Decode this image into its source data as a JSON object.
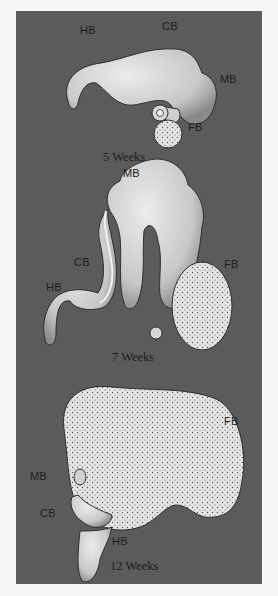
{
  "figure": {
    "panels": [
      {
        "caption": "5 Weeks",
        "labels": {
          "hb": "HB",
          "cb": "CB",
          "mb": "MB",
          "fb": "FB"
        }
      },
      {
        "caption": "7 Weeks",
        "labels": {
          "mb": "MB",
          "cb": "CB",
          "hb": "HB",
          "fb": "FB"
        }
      },
      {
        "caption": "12 Weeks",
        "labels": {
          "fb": "FB",
          "mb": "MB",
          "cb": "CB",
          "hb": "HB"
        }
      }
    ],
    "colors": {
      "background": "#5b5b5b",
      "tissue": "#d8d8d8",
      "page": "#f7f7f7"
    }
  }
}
